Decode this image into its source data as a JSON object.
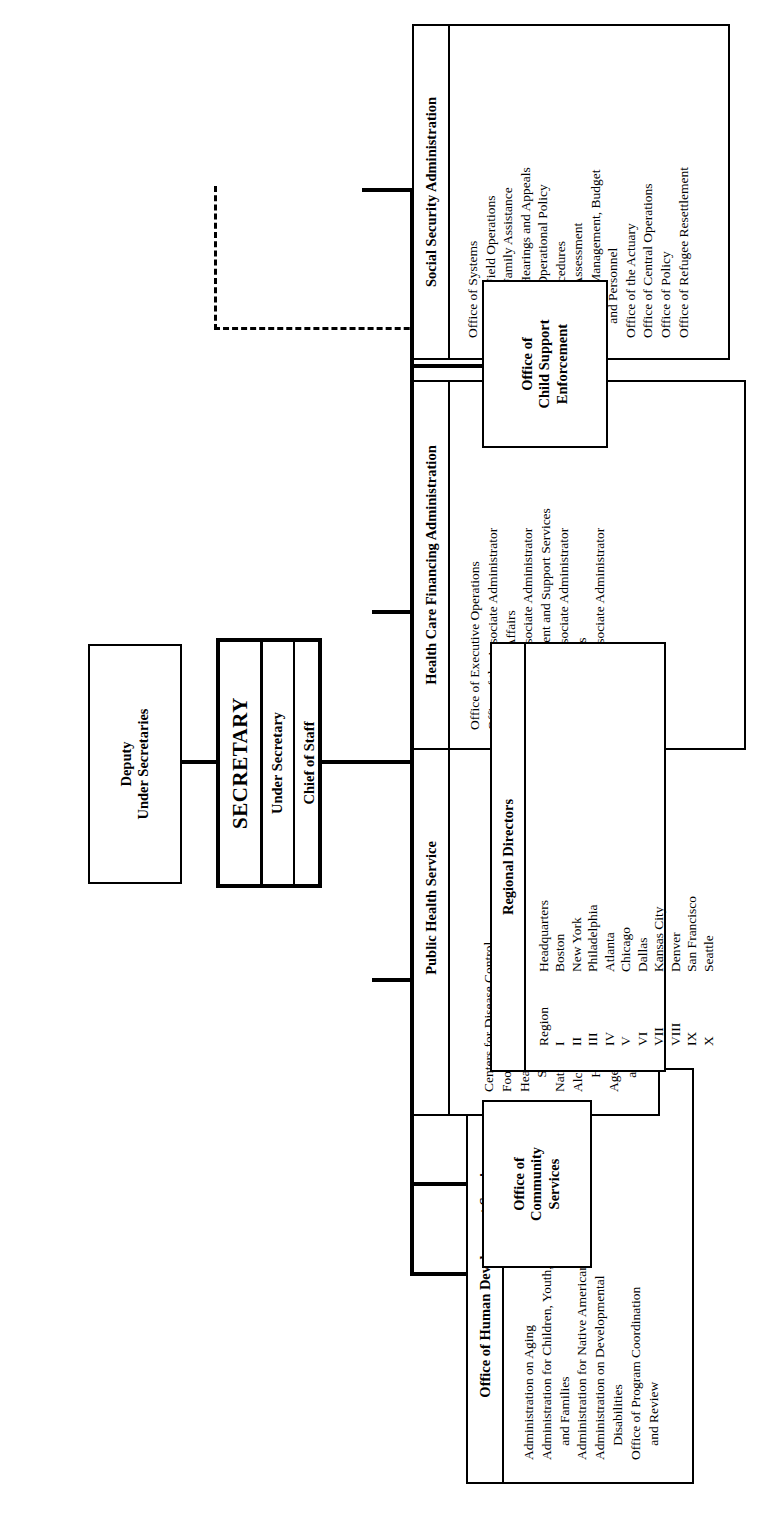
{
  "chart": {
    "type": "org-chart",
    "orientation": "rotated-90-ccw"
  },
  "secretary": {
    "label": "SECRETARY"
  },
  "under_secretary": {
    "label": "Under Secretary"
  },
  "chief_of_staff": {
    "label": "Chief of Staff"
  },
  "deputy_under_secretaries": {
    "label": "Deputy\nUnder Secretaries",
    "line1": "Deputy",
    "line2": "Under Secretaries"
  },
  "executive_assistant": {
    "line1": "Executive Assistant",
    "line2": "to the Secretary"
  },
  "executive_secretary": {
    "line1": "Executive",
    "line2": "Secretary"
  },
  "office_child_support": {
    "line1": "Office of",
    "line2": "Child Support",
    "line3": "Enforcement"
  },
  "office_community_services": {
    "line1": "Office of",
    "line2": "Community",
    "line3": "Services"
  },
  "divisions": [
    {
      "id": "ssa",
      "header": "Social Security Administration",
      "items": [
        {
          "text": "Office of Systems",
          "indent": false
        },
        {
          "text": "Office of Field Operations",
          "indent": false
        },
        {
          "text": "Office of Family Assistance",
          "indent": false
        },
        {
          "text": "Office of Hearings and Appeals",
          "indent": false
        },
        {
          "text": "Office of Operational Policy",
          "indent": false
        },
        {
          "text": "and Procedures",
          "indent": true
        },
        {
          "text": "Office of Assessment",
          "indent": false
        },
        {
          "text": "Office of Management, Budget",
          "indent": false
        },
        {
          "text": "and Personnel",
          "indent": true
        },
        {
          "text": "Office of the Actuary",
          "indent": false
        },
        {
          "text": "Office of Central Operations",
          "indent": false
        },
        {
          "text": "Office of Policy",
          "indent": false
        },
        {
          "text": "Office of Refugee Resettlement",
          "indent": false
        }
      ]
    },
    {
      "id": "hcfa",
      "header": "Health Care Financing Administration",
      "items": [
        {
          "text": "Office of Executive Operations",
          "indent": false
        },
        {
          "text": "Office of the Associate Administrator",
          "indent": false
        },
        {
          "text": "for External Affairs",
          "indent": true
        },
        {
          "text": "Office of the Associate Administrator",
          "indent": false
        },
        {
          "text": "for Management and Support Services",
          "indent": true
        },
        {
          "text": "Office of the Associate Administrator",
          "indent": false
        },
        {
          "text": "for Operations",
          "indent": true
        },
        {
          "text": "Office of the Associate Administrator",
          "indent": false
        },
        {
          "text": "for Policy",
          "indent": true
        }
      ]
    },
    {
      "id": "phs",
      "header": "Public Health Service",
      "items": [
        {
          "text": "Centers for Disease Control",
          "indent": false
        },
        {
          "text": "Food and Drug Administration",
          "indent": false
        },
        {
          "text": "Health Resources and",
          "indent": false
        },
        {
          "text": "Services Administration",
          "indent": true
        },
        {
          "text": "National Institutes of Health",
          "indent": false
        },
        {
          "text": "Alcohol, Drug Abuse, and Mental",
          "indent": false
        },
        {
          "text": "Health Administration",
          "indent": true
        },
        {
          "text": "Agency for Toxic Substances",
          "indent": false
        },
        {
          "text": "and Disease Registry",
          "indent": true
        }
      ]
    },
    {
      "id": "ohds",
      "header": "Office of Human Development Services",
      "items": [
        {
          "text": "Administration on Aging",
          "indent": false
        },
        {
          "text": "Administration for Children, Youth,",
          "indent": false
        },
        {
          "text": "and Families",
          "indent": true
        },
        {
          "text": "Administration for Native Americans",
          "indent": false
        },
        {
          "text": "Administration on Developmental",
          "indent": false
        },
        {
          "text": "Disabilities",
          "indent": true
        },
        {
          "text": "Office of Program Coordination",
          "indent": false
        },
        {
          "text": "and Review",
          "indent": true
        }
      ]
    }
  ],
  "regional_directors": {
    "header": "Regional Directors",
    "col_region": "Region",
    "col_headquarters": "Headquarters",
    "rows": [
      {
        "region": "I",
        "headquarters": "Boston"
      },
      {
        "region": "II",
        "headquarters": "New York"
      },
      {
        "region": "III",
        "headquarters": "Philadelphia"
      },
      {
        "region": "IV",
        "headquarters": "Atlanta"
      },
      {
        "region": "V",
        "headquarters": "Chicago"
      },
      {
        "region": "VI",
        "headquarters": "Dallas"
      },
      {
        "region": "VII",
        "headquarters": "Kansas City"
      },
      {
        "region": "VIII",
        "headquarters": "Denver"
      },
      {
        "region": "IX",
        "headquarters": "San Francisco"
      },
      {
        "region": "X",
        "headquarters": "Seattle"
      }
    ]
  },
  "colors": {
    "line": "#000000",
    "background": "#ffffff"
  }
}
